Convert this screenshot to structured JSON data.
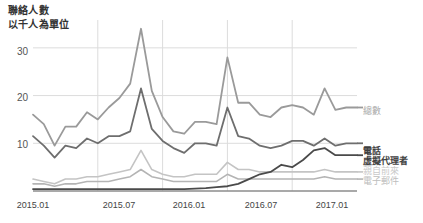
{
  "header": {
    "title": "聯絡人數",
    "subtitle": "以千人為單位"
  },
  "legend": {
    "total": "總數",
    "phone": "電話",
    "virtual_agent": "虛擬代理者",
    "in_person": "親自前來",
    "email": "電子郵件"
  },
  "axis": {
    "y_ticks": [
      "30",
      "20",
      "10"
    ],
    "x_ticks": [
      "2015.01",
      "2015.07",
      "2016.01",
      "2016.07",
      "2017.01"
    ]
  },
  "colors": {
    "total": "#9a9a9a",
    "phone": "#6e6e6e",
    "virtual_agent": "#4a4a4a",
    "in_person": "#c4c4c4",
    "email": "#b4b4b4",
    "grid": "#dcdcdc",
    "axis": "#8c8c8c",
    "text": "#444444"
  },
  "chart_data": {
    "type": "line",
    "title": "聯絡人數",
    "subtitle": "以千人為單位",
    "xlabel": "",
    "ylabel": "以千人為單位",
    "ylim": [
      0,
      35
    ],
    "grid": true,
    "legend_position": "right",
    "x": [
      "2015.01",
      "2015.02",
      "2015.03",
      "2015.04",
      "2015.05",
      "2015.06",
      "2015.07",
      "2015.08",
      "2015.09",
      "2015.10",
      "2015.11",
      "2015.12",
      "2016.01",
      "2016.02",
      "2016.03",
      "2016.04",
      "2016.05",
      "2016.06",
      "2016.07",
      "2016.08",
      "2016.09",
      "2016.10",
      "2016.11",
      "2016.12",
      "2017.01",
      "2017.02",
      "2017.03",
      "2017.04",
      "2017.05",
      "2017.06",
      "2017.07"
    ],
    "series": [
      {
        "name": "總數",
        "color": "#9a9a9a",
        "values": [
          16.0,
          14.0,
          9.5,
          13.5,
          13.5,
          16.5,
          15.0,
          17.5,
          19.5,
          22.5,
          34.0,
          21.0,
          15.5,
          12.5,
          12.0,
          14.5,
          14.5,
          14.0,
          28.0,
          18.5,
          18.5,
          16.0,
          15.5,
          17.5,
          18.0,
          17.5,
          16.0,
          21.5,
          17.0,
          17.5,
          17.5
        ]
      },
      {
        "name": "電話",
        "color": "#6e6e6e",
        "values": [
          11.5,
          9.5,
          7.0,
          9.5,
          9.0,
          11.0,
          10.0,
          11.5,
          11.5,
          12.5,
          21.5,
          13.0,
          10.5,
          9.0,
          8.0,
          10.0,
          10.0,
          9.5,
          17.5,
          11.5,
          11.0,
          9.5,
          9.0,
          9.5,
          10.5,
          10.5,
          9.5,
          11.0,
          9.5,
          10.0,
          10.0
        ]
      },
      {
        "name": "虛擬代理者",
        "color": "#4a4a4a",
        "values": [
          0.4,
          0.4,
          0.4,
          0.4,
          0.4,
          0.4,
          0.4,
          0.4,
          0.4,
          0.4,
          0.4,
          0.4,
          0.4,
          0.4,
          0.4,
          0.5,
          0.6,
          0.8,
          1.0,
          1.5,
          2.5,
          3.5,
          4.0,
          5.5,
          5.0,
          6.5,
          8.5,
          9.0,
          7.5,
          7.5,
          7.5
        ]
      },
      {
        "name": "親自前來",
        "color": "#c4c4c4",
        "values": [
          2.5,
          2.0,
          1.5,
          2.5,
          2.5,
          3.0,
          3.0,
          3.5,
          4.0,
          4.5,
          8.5,
          4.5,
          3.5,
          3.0,
          3.0,
          3.5,
          3.5,
          3.5,
          6.0,
          4.5,
          4.5,
          4.0,
          4.0,
          4.0,
          4.0,
          4.0,
          4.0,
          4.5,
          4.0,
          4.0,
          4.0
        ]
      },
      {
        "name": "電子郵件",
        "color": "#b4b4b4",
        "values": [
          1.5,
          1.5,
          1.0,
          1.5,
          1.5,
          2.0,
          2.0,
          2.0,
          2.5,
          3.0,
          4.5,
          3.0,
          2.5,
          2.0,
          2.0,
          2.0,
          2.0,
          2.0,
          3.5,
          2.5,
          2.5,
          2.5,
          2.5,
          2.5,
          2.5,
          2.5,
          2.5,
          3.0,
          2.5,
          2.5,
          2.5
        ]
      }
    ]
  }
}
